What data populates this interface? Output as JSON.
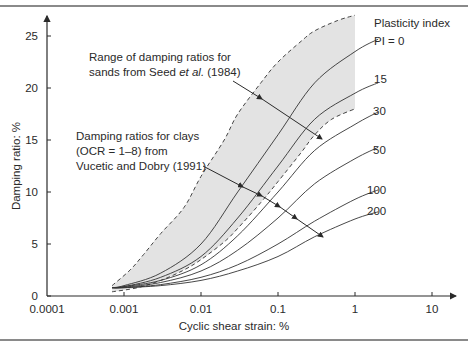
{
  "chart_data": {
    "type": "line",
    "title": "",
    "xlabel": "Cyclic shear strain: %",
    "ylabel": "Damping ratio: %",
    "xscale": "log",
    "xlim": [
      0.0001,
      10
    ],
    "ylim": [
      0,
      27
    ],
    "x_ticks": [
      "0.0001",
      "0.001",
      "0.01",
      "0.1",
      "1",
      "10"
    ],
    "y_ticks": [
      "0",
      "5",
      "10",
      "15",
      "20",
      "25"
    ],
    "grid": false,
    "legend_title": "Plasticity index",
    "band": {
      "name": "Range of damping ratios for sands from Seed et al. (1984)",
      "upper": [
        [
          0.0007,
          1.0
        ],
        [
          0.0012,
          2.5
        ],
        [
          0.0018,
          4.0
        ],
        [
          0.003,
          6.0
        ],
        [
          0.006,
          8.5
        ],
        [
          0.01,
          11.5
        ],
        [
          0.02,
          15.0
        ],
        [
          0.03,
          17.5
        ],
        [
          0.06,
          20.5
        ],
        [
          0.1,
          22.5
        ],
        [
          0.2,
          24.5
        ],
        [
          0.3,
          25.5
        ],
        [
          0.6,
          26.5
        ],
        [
          1.0,
          27.0
        ]
      ],
      "lower": [
        [
          0.0007,
          0.4
        ],
        [
          0.0015,
          0.8
        ],
        [
          0.003,
          1.5
        ],
        [
          0.006,
          2.5
        ],
        [
          0.01,
          3.5
        ],
        [
          0.02,
          5.2
        ],
        [
          0.03,
          6.5
        ],
        [
          0.06,
          9.0
        ],
        [
          0.1,
          11.0
        ],
        [
          0.2,
          13.8
        ],
        [
          0.3,
          15.5
        ],
        [
          0.5,
          17.0
        ],
        [
          1.0,
          18.0
        ]
      ]
    },
    "series": [
      {
        "name": "PI = 0",
        "x": [
          0.0007,
          0.001,
          0.003,
          0.01,
          0.03,
          0.1,
          0.3,
          1.0,
          2.0
        ],
        "y": [
          0.8,
          1.0,
          2.2,
          5.0,
          10.0,
          15.5,
          20.5,
          23.5,
          24.7
        ]
      },
      {
        "name": "15",
        "x": [
          0.0007,
          0.001,
          0.003,
          0.01,
          0.03,
          0.1,
          0.3,
          1.0,
          2.0
        ],
        "y": [
          0.8,
          0.9,
          1.8,
          3.8,
          7.5,
          12.5,
          17.0,
          19.5,
          20.5
        ]
      },
      {
        "name": "30",
        "x": [
          0.0007,
          0.001,
          0.003,
          0.01,
          0.03,
          0.1,
          0.3,
          1.0,
          2.0
        ],
        "y": [
          0.8,
          0.9,
          1.5,
          3.0,
          5.8,
          10.0,
          14.0,
          16.5,
          17.7
        ]
      },
      {
        "name": "50",
        "x": [
          0.0007,
          0.001,
          0.003,
          0.01,
          0.03,
          0.1,
          0.3,
          1.0,
          2.0
        ],
        "y": [
          0.8,
          0.85,
          1.3,
          2.4,
          4.4,
          7.5,
          10.8,
          13.2,
          14.3
        ]
      },
      {
        "name": "100",
        "x": [
          0.0007,
          0.001,
          0.003,
          0.01,
          0.03,
          0.1,
          0.3,
          1.0,
          2.0
        ],
        "y": [
          0.8,
          0.8,
          1.1,
          1.8,
          3.0,
          5.0,
          7.2,
          9.3,
          10.2
        ]
      },
      {
        "name": "200",
        "x": [
          0.0007,
          0.001,
          0.003,
          0.01,
          0.03,
          0.1,
          0.3,
          1.0,
          2.0
        ],
        "y": [
          0.8,
          0.8,
          1.0,
          1.5,
          2.4,
          3.8,
          5.7,
          7.4,
          8.1
        ]
      }
    ],
    "annotations": [
      {
        "lines": [
          "Range of damping ratios for",
          "sands from Seed et al. (1984)"
        ]
      },
      {
        "lines": [
          "Damping ratios for clays",
          "(OCR = 1–8) from",
          "Vucetic and Dobry (1991)"
        ]
      }
    ]
  },
  "labels": {
    "x_axis": "Cyclic shear strain: %",
    "y_axis": "Damping ratio: %",
    "legend_title": "Plasticity index",
    "pi": [
      "PI = 0",
      "15",
      "30",
      "50",
      "100",
      "200"
    ],
    "sands_1": "Range of damping ratios for",
    "sands_2a": "sands from Seed ",
    "sands_2b": "et al.",
    "sands_2c": " (1984)",
    "clays_1": "Damping ratios for clays",
    "clays_2": "(OCR = 1–8) from",
    "clays_3": "Vucetic and Dobry (1991)"
  },
  "colors": {
    "band_fill": "#e3e3e3",
    "line": "#333333",
    "axis": "#2a2a2a"
  }
}
